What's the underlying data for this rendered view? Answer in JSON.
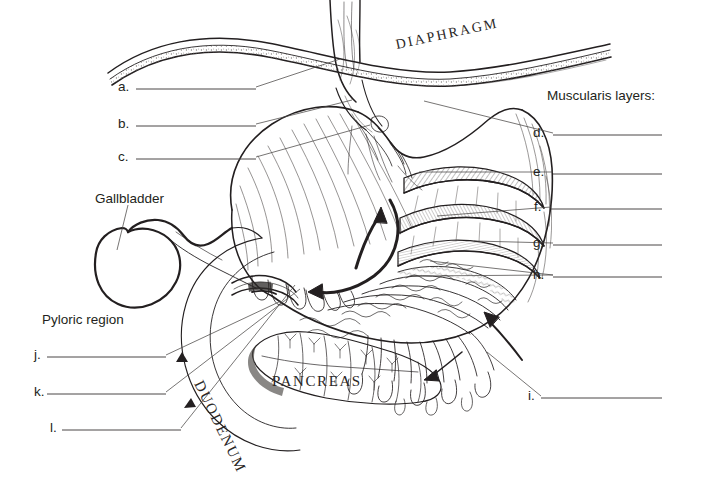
{
  "figure": {
    "background_color": "#ffffff",
    "ink_color": "#231f20"
  },
  "headings": {
    "muscularis": "Muscularis layers:"
  },
  "organ_labels": [
    {
      "id": "diaphragm",
      "text": "DIAPHRAGM",
      "style": "serif-caps-spaced",
      "rotation": -12,
      "x": 396,
      "y": 38
    },
    {
      "id": "pancreas",
      "text": "PANCREAS",
      "style": "serif-caps-spaced",
      "rotation": 0,
      "x": 272,
      "y": 381
    },
    {
      "id": "duodenum",
      "text": "DUODENUM",
      "style": "serif-caps-spaced",
      "rotation": 64,
      "x": 205,
      "y": 381
    }
  ],
  "named_labels": [
    {
      "id": "gallbladder",
      "text": "Gallbladder",
      "x": 95,
      "y": 192,
      "has_leader": true
    },
    {
      "id": "pyloric-region",
      "text": "Pyloric region",
      "x": 42,
      "y": 313,
      "has_leader": false
    }
  ],
  "blanks": [
    {
      "letter": "a.",
      "x": 118,
      "y": 80,
      "line_x1": 136,
      "line_x2": 256,
      "line_y": 89,
      "leader": "M256,87 L340,59"
    },
    {
      "letter": "b.",
      "x": 118,
      "y": 117,
      "line_x1": 136,
      "line_x2": 256,
      "line_y": 126,
      "leader": "M256,124 L352,100"
    },
    {
      "letter": "c.",
      "x": 118,
      "y": 150,
      "line_x1": 136,
      "line_x2": 256,
      "line_y": 159,
      "leader": "M256,157 L370,125"
    },
    {
      "letter": "d.",
      "x": 533,
      "y": 126,
      "line_x1": 553,
      "line_x2": 662,
      "line_y": 135,
      "leader": "M553,133 L424,101"
    },
    {
      "letter": "e.",
      "x": 533,
      "y": 165,
      "line_x1": 553,
      "line_x2": 662,
      "line_y": 174,
      "leader": "M553,172 L419,172"
    },
    {
      "letter": "f.",
      "x": 534,
      "y": 200,
      "line_x1": 551,
      "line_x2": 662,
      "line_y": 209,
      "leader": "M551,207 L437,216"
    },
    {
      "letter": "g.",
      "x": 533,
      "y": 236,
      "line_x1": 553,
      "line_x2": 662,
      "line_y": 245,
      "leader": "M553,243 L474,241"
    },
    {
      "letter": "h.",
      "x": 533,
      "y": 268,
      "line_x1": 553,
      "line_x2": 662,
      "line_y": 277,
      "leader": "M553,275 L430,261"
    },
    {
      "letter": "i.",
      "x": 528,
      "y": 389,
      "line_x1": 541,
      "line_x2": 662,
      "line_y": 398,
      "leader": "M541,396 L487,352"
    },
    {
      "letter": "j.",
      "x": 34,
      "y": 348,
      "line_x1": 47,
      "line_x2": 166,
      "line_y": 357,
      "leader": "M166,355 L281,301"
    },
    {
      "letter": "k.",
      "x": 34,
      "y": 385,
      "line_x1": 47,
      "line_x2": 166,
      "line_y": 394,
      "leader": "M166,392 L300,289"
    },
    {
      "letter": "l.",
      "x": 50,
      "y": 421,
      "line_x1": 62,
      "line_x2": 181,
      "line_y": 430,
      "leader": "M181,428 L295,285"
    }
  ],
  "secondary_leaders": [
    {
      "id": "h-second-branch",
      "path": "M553,275 L412,276"
    },
    {
      "id": "gallbladder-leader",
      "path": "M128,205 L117,250"
    }
  ],
  "illustration": {
    "description": "Line-art of stomach with cut-away muscularis layers, rugae, esophagus through diaphragm, gallbladder, duodenum C-loop and pancreas",
    "arrows": [
      {
        "id": "arrow-up-lesser-curvature",
        "direction": "up"
      },
      {
        "id": "arrow-left-greater-curvature",
        "direction": "left"
      },
      {
        "id": "arrow-pointing-stomach-wall",
        "direction": "upper-left"
      },
      {
        "id": "arrow-pointing-serosa",
        "direction": "down-left"
      }
    ]
  }
}
